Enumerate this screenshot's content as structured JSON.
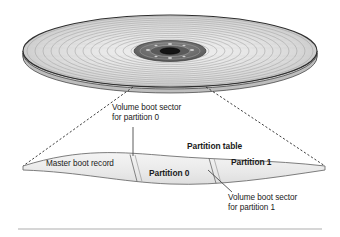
{
  "figure": {
    "background_color": "#ffffff",
    "text_color": "#1a1a1a",
    "band_fill": "#ebebeb",
    "band_stroke": "#7a7a7a"
  },
  "disk": {
    "name": "disk-platter",
    "outer_fill": "#e8e8e8",
    "track_color": "#9a9a9a",
    "hub_fill": "#6e6e6e",
    "spindle_fill": "#1c1c1c",
    "track_count": 14
  },
  "labels": {
    "volume_boot_sector_0": "Volume boot sector\nfor partition 0",
    "volume_boot_sector_1": "Volume boot sector\nfor partition 1",
    "partition_table": "Partition table",
    "master_boot_record": "Master boot record",
    "partition_0": "Partition 0",
    "partition_1": "Partition 1"
  },
  "leaders": {
    "vbs0_line": "vertical leader from caption down to band boundary",
    "vbs1_line": "diagonal leader from band boundary down-right to caption",
    "callout_left": "dashed line from disk left edge to band left tip",
    "callout_right": "dashed line from disk right edge to band right tip"
  },
  "footer_rule": {
    "color": "#c9c9c9",
    "visible": true
  }
}
